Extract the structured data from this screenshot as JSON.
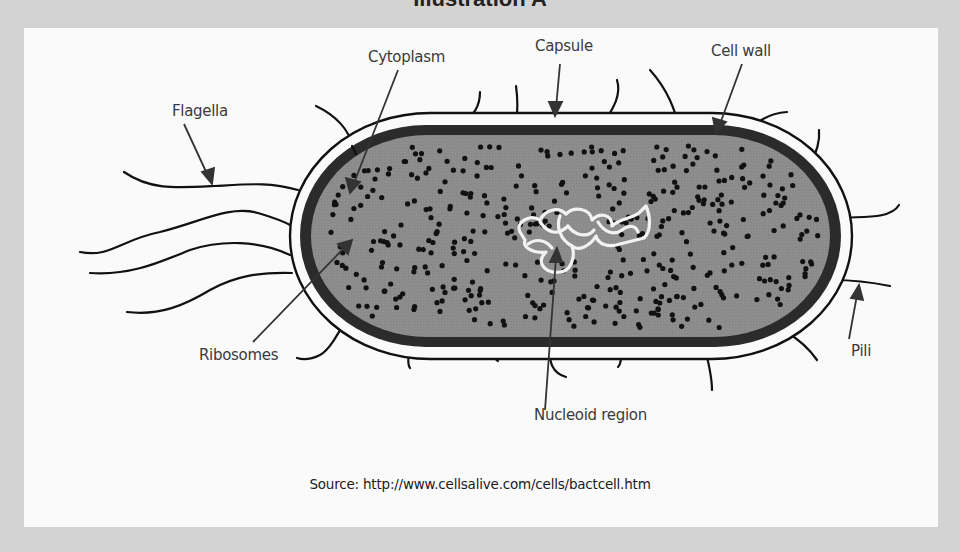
{
  "title": "Illustration A",
  "diagram": {
    "labels": {
      "flagella": "Flagella",
      "cytoplasm": "Cytoplasm",
      "capsule": "Capsule",
      "cell_wall": "Cell wall",
      "ribosomes": "Ribosomes",
      "nucleoid": "Nucleoid region",
      "pili": "Pili"
    },
    "colors": {
      "background": "#d3d3d3",
      "panel": "#fafafa",
      "cytoplasm": "#8c8c8c",
      "cell_wall": "#2b2b2b",
      "outline": "#111111",
      "nucleoid": "#f2f2f2",
      "label_text": "#3a3a3a"
    }
  },
  "source": "Source: http://www.cellsalive.com/cells/bactcell.htm"
}
